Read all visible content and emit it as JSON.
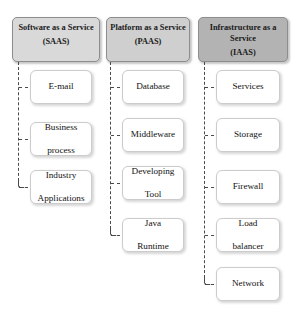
{
  "diagram": {
    "columns": [
      {
        "id": "saas",
        "header": {
          "name": "Software as a Service",
          "line1": "Software as a",
          "line2": "Service",
          "abbr": "(SAAS)",
          "fill": "#d9d9d9"
        },
        "items": [
          {
            "label": "E-mail",
            "line1": "E-mail",
            "line2": ""
          },
          {
            "label": "Business process",
            "line1": "Business",
            "line2": "process"
          },
          {
            "label": "Industry Applications",
            "line1": "Industry",
            "line2": "Applications"
          }
        ]
      },
      {
        "id": "paas",
        "header": {
          "name": "Platform as a Service",
          "line1": "Platform as a",
          "line2": "Service",
          "abbr": "(PAAS)",
          "fill": "#cfcfcf"
        },
        "items": [
          {
            "label": "Database",
            "line1": "Database",
            "line2": ""
          },
          {
            "label": "Middleware",
            "line1": "Middleware",
            "line2": ""
          },
          {
            "label": "Developing Tool",
            "line1": "Developing",
            "line2": "Tool"
          },
          {
            "label": "Java Runtime",
            "line1": "Java",
            "line2": "Runtime"
          }
        ]
      },
      {
        "id": "iaas",
        "header": {
          "name": "Infrastructure as a Service",
          "line1": "Infrastructure as",
          "line2": "a Service",
          "abbr": "(IAAS)",
          "fill": "#b3b3b3"
        },
        "items": [
          {
            "label": "Services",
            "line1": "Services",
            "line2": ""
          },
          {
            "label": "Storage",
            "line1": "Storage",
            "line2": ""
          },
          {
            "label": "Firewall",
            "line1": "Firewall",
            "line2": ""
          },
          {
            "label": "Load balancer",
            "line1": "Load",
            "line2": "balancer"
          },
          {
            "label": "Network",
            "line1": "Network",
            "line2": ""
          }
        ]
      }
    ],
    "connector": {
      "style": "dashed",
      "color": "#4a4a4a"
    }
  }
}
